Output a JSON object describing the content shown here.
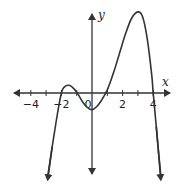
{
  "chart_data": {
    "type": "line",
    "title": "",
    "xlabel": "x",
    "ylabel": "y",
    "xlim": [
      -5,
      5
    ],
    "ylim": [
      -5.5,
      5.5
    ],
    "x_ticks": [
      -4,
      -3,
      -2,
      -1,
      1,
      2,
      3,
      4
    ],
    "x_tick_labels": [
      {
        "value": -4,
        "text": "−4"
      },
      {
        "value": -2,
        "text": "−2"
      },
      {
        "value": 0,
        "text": "0"
      },
      {
        "value": 2,
        "text": "2"
      },
      {
        "value": 4,
        "text": "4"
      }
    ],
    "grid": false,
    "legend": "none",
    "series": [
      {
        "name": "polynomial curve",
        "description": "Quartic-like curve with roots near x = -2, -0.7, 1, 4; local max near (-1.5, 0.5), local min near (0.1, -1.1), absolute max near (3, 5.3); both ends point downward",
        "x": [
          -2.9,
          -2.6,
          -2.3,
          -2.0,
          -1.8,
          -1.5,
          -1.2,
          -0.9,
          -0.6,
          -0.3,
          0.0,
          0.3,
          0.6,
          1.0,
          1.4,
          1.8,
          2.2,
          2.6,
          3.0,
          3.3,
          3.6,
          3.9,
          4.0,
          4.2,
          4.5
        ],
        "y": [
          -5.5,
          -3.5,
          -1.6,
          0.0,
          0.4,
          0.5,
          0.3,
          -0.1,
          -0.6,
          -0.95,
          -1.1,
          -0.9,
          -0.5,
          0.2,
          1.3,
          2.6,
          3.9,
          4.9,
          5.3,
          5.0,
          3.6,
          1.2,
          0.0,
          -2.2,
          -5.5
        ]
      }
    ]
  }
}
